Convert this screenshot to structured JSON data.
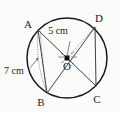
{
  "figure": {
    "background_color": "#fbfbfa",
    "stroke_color": "#1a1a1a",
    "points": [
      {
        "id": "A",
        "label": "A",
        "position": "upper-left",
        "label_x": 28,
        "label_y": 28
      },
      {
        "id": "D",
        "label": "D",
        "position": "upper-right",
        "label_x": 99,
        "label_y": 22
      },
      {
        "id": "B",
        "label": "B",
        "position": "lower-left",
        "label_x": 41,
        "label_y": 106
      },
      {
        "id": "C",
        "label": "C",
        "position": "lower-right",
        "label_x": 97,
        "label_y": 103
      },
      {
        "id": "O",
        "label": "O",
        "position": "center",
        "label_x": 64,
        "label_y": 70
      }
    ],
    "measurements": [
      {
        "id": "radius",
        "value": "5 cm",
        "label_x": 58,
        "label_y": 34,
        "refers_to": "OD"
      },
      {
        "id": "chord",
        "value": "7 cm",
        "label_x": 4,
        "label_y": 74,
        "refers_to": "AB"
      }
    ],
    "circle": {
      "cx": 67,
      "cy": 58,
      "r": 40
    },
    "segments": [
      {
        "from": "A",
        "to": "C",
        "style": "solid",
        "name": "diagonal-ac"
      },
      {
        "from": "B",
        "to": "D",
        "style": "solid",
        "name": "diagonal-bd"
      },
      {
        "from": "A",
        "to": "B",
        "style": "solid",
        "name": "chord-ab"
      },
      {
        "from": "D",
        "to": "C",
        "style": "solid",
        "name": "chord-dc"
      },
      {
        "from": "O",
        "to": "D",
        "style": "dotted",
        "name": "radius-od"
      },
      {
        "from": "A",
        "to": "B",
        "style": "dotted",
        "name": "chord-ab-measure"
      }
    ]
  }
}
